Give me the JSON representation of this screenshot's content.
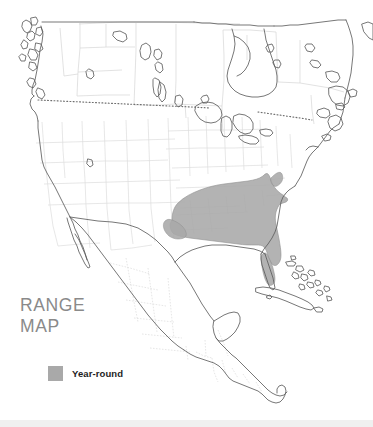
{
  "figure": {
    "name": "north-america-range-map",
    "title_line1": "RANGE",
    "title_line2": "MAP",
    "title_text": "RANGE\nMAP"
  },
  "legend": {
    "items": [
      {
        "label": "Year-round",
        "color": "#a9a9a9",
        "swatch_name": "year-round-swatch"
      }
    ]
  },
  "colors": {
    "background": "#ffffff",
    "range_fill": "#a9a9a9",
    "range_stroke": "#8e8e8e",
    "coastline": "#5a5a5a",
    "internal_border": "#d0d0d0",
    "country_border_dotted": "#7a7a7a",
    "title_text": "#8a8a8a",
    "legend_text": "#1d1d1d",
    "footer_bar": "#f0f0f0"
  },
  "map": {
    "projection_extent": "North America: Alaska panhandle and Canada through Mexico, Central America and the Caribbean",
    "regions_depicted": [
      "Canada",
      "United States",
      "Mexico",
      "Central America",
      "Cuba",
      "Bahamas",
      "Greenland coast",
      "Newfoundland"
    ],
    "range_description": "Year-round range shaded across the southeastern United States from eastern Texas through Florida north to Maryland",
    "dotted_line_label": "United States / Canada border"
  }
}
